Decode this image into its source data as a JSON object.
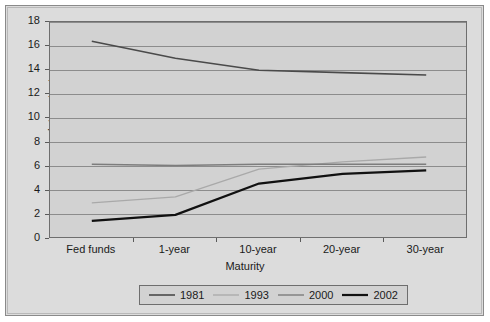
{
  "chart_data": {
    "type": "line",
    "title": "",
    "subtitle": "",
    "xlabel": "Maturity",
    "ylabel": "Interest rate",
    "categories": [
      "Fed funds",
      "1-year",
      "10-year",
      "20-year",
      "30-year"
    ],
    "ylim": [
      0,
      18
    ],
    "yticks": [
      0,
      2,
      4,
      6,
      8,
      10,
      12,
      14,
      16,
      18
    ],
    "ytick_labels": [
      "0",
      "2",
      "4",
      "6",
      "8",
      "10",
      "12",
      "14",
      "16",
      "18"
    ],
    "grid": "horizontal",
    "legend_position": "bottom-center",
    "series": [
      {
        "name": "1981",
        "color": "#4a4a4a",
        "width": 1.6,
        "values": [
          16.4,
          15.0,
          14.0,
          13.8,
          13.6
        ]
      },
      {
        "name": "1993",
        "color": "#a9a9a9",
        "width": 1.3,
        "values": [
          3.0,
          3.5,
          5.8,
          6.4,
          6.8
        ]
      },
      {
        "name": "2000",
        "color": "#7d7d7d",
        "width": 1.4,
        "values": [
          6.2,
          6.1,
          6.2,
          6.2,
          6.2
        ]
      },
      {
        "name": "2002",
        "color": "#111111",
        "width": 2.2,
        "values": [
          1.5,
          2.0,
          4.6,
          5.4,
          5.7
        ]
      }
    ]
  },
  "legend": {
    "entries": [
      "1981",
      "1993",
      "2000",
      "2002"
    ]
  },
  "axes": {
    "y_title": "Interest rate",
    "x_title": "Maturity"
  },
  "colors": {
    "plot_background": "#d2d2d2",
    "figure_background": "#dcdcdc",
    "gridline": "#8c8c8c",
    "axis": "#6e6e6e",
    "text": "#1a1a1a"
  }
}
